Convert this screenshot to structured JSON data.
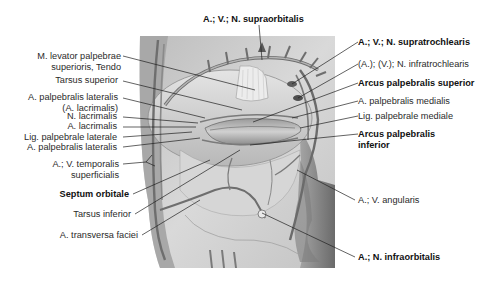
{
  "figure": {
    "palette": {
      "background": "#ffffff",
      "text": "#222222",
      "line": "#1a1a1a",
      "illustration_base": "#c8c8c8"
    }
  },
  "labels": {
    "top": [
      {
        "id": "supraorbitalis",
        "text": "A.; V.; N. supraorbitalis",
        "bold": true
      }
    ],
    "left": [
      {
        "id": "levator",
        "lines": [
          "M. levator palpebrae",
          "superioris, Tendo"
        ],
        "bold": false
      },
      {
        "id": "tarsus_superior",
        "text": "Tarsus superior",
        "bold": false
      },
      {
        "id": "palp_lat_1",
        "lines": [
          "A. palpebralis lateralis",
          "(A. lacrimalis)"
        ],
        "bold": false
      },
      {
        "id": "n_lacrimalis",
        "text": "N. lacrimalis",
        "bold": false
      },
      {
        "id": "a_lacrimalis",
        "text": "A. lacrimalis",
        "bold": false
      },
      {
        "id": "lig_lat",
        "text": "Lig. palpebrale laterale",
        "bold": false
      },
      {
        "id": "palp_lat_2",
        "text": "A. palpebralis lateralis",
        "bold": false
      },
      {
        "id": "temporalis",
        "lines": [
          "A.; V. temporalis",
          "superficialis"
        ],
        "bold": false
      },
      {
        "id": "septum",
        "text": "Septum orbitale",
        "bold": true
      },
      {
        "id": "tarsus_inferior",
        "text": "Tarsus inferior",
        "bold": false
      },
      {
        "id": "transversa",
        "text": "A. transversa faciei",
        "bold": false
      }
    ],
    "right": [
      {
        "id": "supratrochlearis",
        "text": "A.; V.; N. supratrochlearis",
        "bold": true
      },
      {
        "id": "infratrochlearis",
        "text": "(A.); (V.); N. infratrochlearis",
        "bold": false
      },
      {
        "id": "arcus_sup",
        "text": "Arcus palpebralis superior",
        "bold": true
      },
      {
        "id": "palp_med",
        "text": "A. palpebralis medialis",
        "bold": false
      },
      {
        "id": "lig_med",
        "text": "Lig. palpebrale mediale",
        "bold": false
      },
      {
        "id": "arcus_inf",
        "lines": [
          "Arcus palpebralis",
          "inferior"
        ],
        "bold": true
      },
      {
        "id": "angularis",
        "text": "A.; V. angularis",
        "bold": false
      },
      {
        "id": "infraorbitalis",
        "text": "A.; N. infraorbitalis",
        "bold": true
      }
    ]
  }
}
